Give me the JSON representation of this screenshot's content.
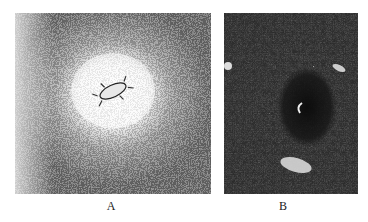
{
  "figure": {
    "panels": [
      {
        "id": "A",
        "label": "A",
        "description": "Grainy micrograph with a bright circular halo around a small dark elongated central object"
      },
      {
        "id": "B",
        "label": "B",
        "description": "Dark dense reticular micrograph with a dark circular region right of center and a pale elongated patch below"
      }
    ]
  },
  "colors": {
    "background": "#ffffff",
    "ink": "#2a2a2a",
    "paper": "#f4f4f4"
  }
}
